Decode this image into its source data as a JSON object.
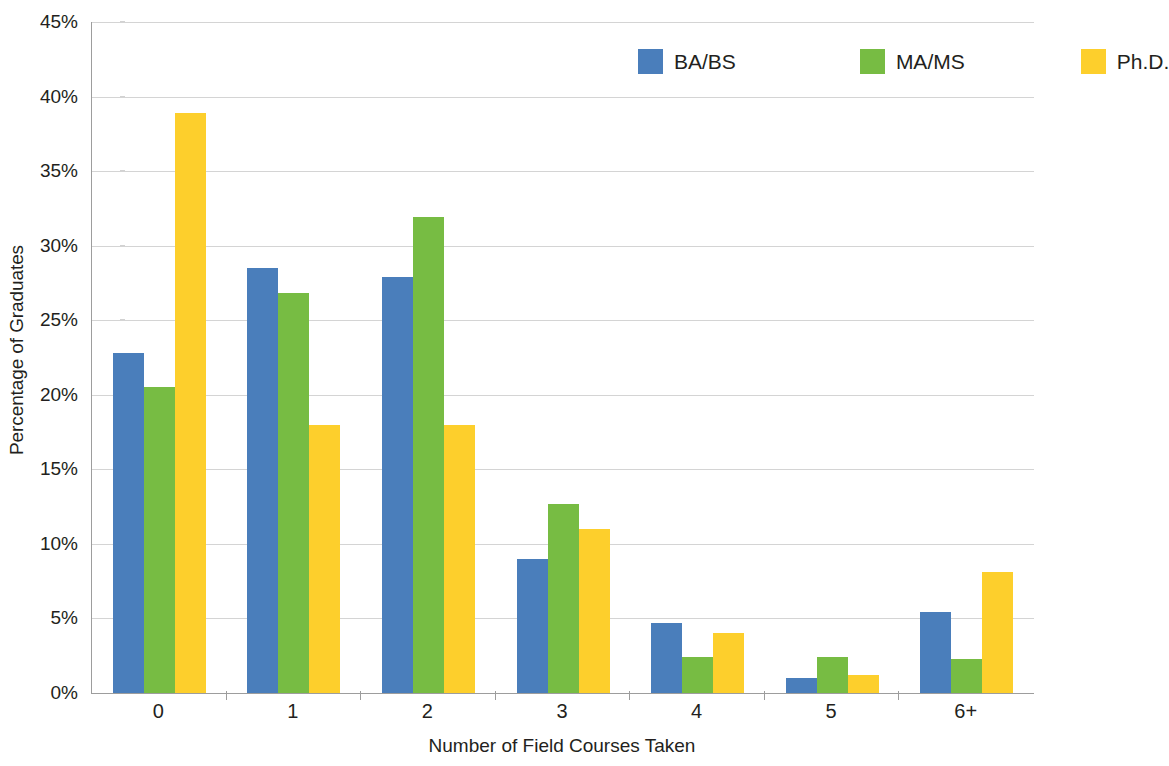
{
  "chart_data": {
    "type": "bar",
    "title": "",
    "xlabel": "Number of Field Courses Taken",
    "ylabel": "Percentage of Graduates",
    "categories": [
      "0",
      "1",
      "2",
      "3",
      "4",
      "5",
      "6+"
    ],
    "ylim": [
      0,
      45
    ],
    "ytick_labels": [
      "0%",
      "5%",
      "10%",
      "15%",
      "20%",
      "25%",
      "30%",
      "35%",
      "40%",
      "45%"
    ],
    "ytick_values": [
      0,
      5,
      10,
      15,
      20,
      25,
      30,
      35,
      40,
      45
    ],
    "grid": true,
    "legend_position": "top-right",
    "series": [
      {
        "name": "BA/BS",
        "color": "#4a7ebb",
        "values": [
          22.8,
          28.5,
          27.9,
          9.0,
          4.7,
          1.0,
          5.4
        ]
      },
      {
        "name": "MA/MS",
        "color": "#77bc43",
        "values": [
          20.5,
          26.8,
          31.9,
          12.7,
          2.4,
          2.4,
          2.3
        ]
      },
      {
        "name": "Ph.D.",
        "color": "#fdcf2c",
        "values": [
          38.9,
          18.0,
          18.0,
          11.0,
          4.0,
          1.2,
          8.1
        ]
      }
    ]
  },
  "axis": {
    "y_title": "Percentage of Graduates",
    "x_title": "Number of Field Courses Taken"
  },
  "legend": {
    "items": [
      {
        "label": "BA/BS",
        "color": "#4a7ebb"
      },
      {
        "label": "MA/MS",
        "color": "#77bc43"
      },
      {
        "label": "Ph.D.",
        "color": "#fdcf2c"
      }
    ]
  }
}
